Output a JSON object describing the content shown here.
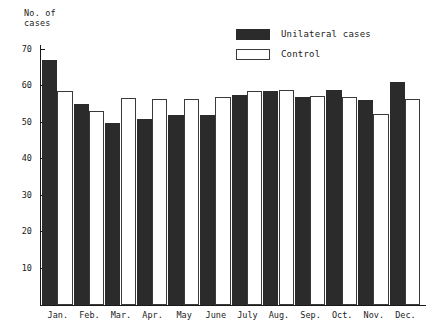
{
  "chart_data": {
    "type": "bar",
    "title": "",
    "ylabel": "No. of\ncases",
    "ylabel_line1": "No. of",
    "ylabel_line2": "cases",
    "xlabel": "",
    "ylim": [
      0,
      72
    ],
    "yticks": [
      10,
      20,
      30,
      40,
      50,
      60,
      70
    ],
    "ytick_labels": [
      "10",
      "20",
      "30",
      "40",
      "50",
      "60",
      "70"
    ],
    "grid": false,
    "legend_position": "top-right",
    "categories": [
      "Jan.",
      "Feb.",
      "Mar.",
      "Apr.",
      "May",
      "June",
      "July",
      "Aug.",
      "Sep.",
      "Oct.",
      "Nov.",
      "Dec."
    ],
    "series": [
      {
        "name": "Unilateral cases",
        "fill": "#2b2b2b",
        "values": [
          67,
          55,
          49.7,
          51,
          52,
          52,
          57.5,
          58.5,
          57,
          58.8,
          56,
          61
        ]
      },
      {
        "name": "Control",
        "fill": "#ffffff",
        "values": [
          58.5,
          53,
          56.6,
          56.5,
          56.5,
          57,
          58.5,
          58.8,
          57.3,
          57,
          52.3,
          56.5
        ]
      }
    ]
  },
  "legend": {
    "items": [
      {
        "label": "Unilateral cases",
        "style": "filled"
      },
      {
        "label": "Control",
        "style": "open"
      }
    ]
  },
  "colors": {
    "bar_filled": "#2b2b2b",
    "bar_open_border": "#3a3a3a",
    "axis": "#1a1a1a",
    "text": "#222222",
    "background": "#ffffff"
  }
}
